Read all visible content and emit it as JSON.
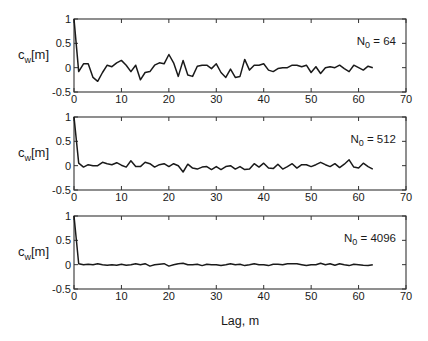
{
  "figure": {
    "xlabel": "Lag, m",
    "ylabel_main": "c",
    "ylabel_sub": "w",
    "ylabel_tail": "[m]"
  },
  "chart_data": [
    {
      "type": "line",
      "title": "",
      "annotation": {
        "main": "N",
        "sub": "0",
        "tail": " = 64"
      },
      "xlabel": "",
      "ylabel": "c_w[m]",
      "xlim": [
        0,
        70
      ],
      "ylim": [
        -0.5,
        1
      ],
      "xticks": [
        0,
        10,
        20,
        30,
        40,
        50,
        60,
        70
      ],
      "yticks": [
        -0.5,
        0,
        0.5,
        1
      ],
      "ytick_labels": [
        "-0.5",
        "0",
        "0.5",
        "1"
      ],
      "grid": false,
      "x": [
        0,
        1,
        2,
        3,
        4,
        5,
        6,
        7,
        8,
        9,
        10,
        11,
        12,
        13,
        14,
        15,
        16,
        17,
        18,
        19,
        20,
        21,
        22,
        23,
        24,
        25,
        26,
        27,
        28,
        29,
        30,
        31,
        32,
        33,
        34,
        35,
        36,
        37,
        38,
        39,
        40,
        41,
        42,
        43,
        44,
        45,
        46,
        47,
        48,
        49,
        50,
        51,
        52,
        53,
        54,
        55,
        56,
        57,
        58,
        59,
        60,
        61,
        62,
        63
      ],
      "values": [
        1.0,
        -0.08,
        0.08,
        0.08,
        -0.2,
        -0.28,
        -0.1,
        0.05,
        0.02,
        0.1,
        0.15,
        0.05,
        -0.08,
        0.05,
        -0.25,
        -0.1,
        -0.08,
        0.05,
        0.1,
        0.08,
        0.27,
        0.1,
        -0.18,
        0.15,
        -0.15,
        -0.18,
        0.03,
        0.05,
        0.05,
        -0.02,
        0.08,
        -0.1,
        -0.2,
        -0.03,
        -0.2,
        -0.18,
        0.17,
        -0.05,
        0.05,
        0.05,
        0.08,
        -0.05,
        -0.08,
        -0.02,
        0.0,
        0.0,
        0.05,
        0.05,
        0.02,
        0.05,
        -0.1,
        0.02,
        -0.12,
        0.0,
        0.02,
        0.0,
        0.05,
        -0.02,
        -0.08,
        0.05,
        0.0,
        -0.05,
        0.03,
        0.0
      ]
    },
    {
      "type": "line",
      "title": "",
      "annotation": {
        "main": "N",
        "sub": "0",
        "tail": " = 512"
      },
      "xlabel": "",
      "ylabel": "c_w[m]",
      "xlim": [
        0,
        70
      ],
      "ylim": [
        -0.5,
        1
      ],
      "xticks": [
        0,
        10,
        20,
        30,
        40,
        50,
        60,
        70
      ],
      "yticks": [
        -0.5,
        0,
        0.5,
        1
      ],
      "ytick_labels": [
        "-0.5",
        "0",
        "0.5",
        "1"
      ],
      "grid": false,
      "x": [
        0,
        1,
        2,
        3,
        4,
        5,
        6,
        7,
        8,
        9,
        10,
        11,
        12,
        13,
        14,
        15,
        16,
        17,
        18,
        19,
        20,
        21,
        22,
        23,
        24,
        25,
        26,
        27,
        28,
        29,
        30,
        31,
        32,
        33,
        34,
        35,
        36,
        37,
        38,
        39,
        40,
        41,
        42,
        43,
        44,
        45,
        46,
        47,
        48,
        49,
        50,
        51,
        52,
        53,
        54,
        55,
        56,
        57,
        58,
        59,
        60,
        61,
        62,
        63
      ],
      "values": [
        1.0,
        0.05,
        -0.03,
        0.02,
        0.0,
        0.0,
        0.07,
        0.04,
        0.02,
        0.06,
        0.01,
        -0.03,
        0.1,
        -0.02,
        -0.02,
        0.07,
        0.04,
        -0.03,
        0.02,
        0.04,
        -0.02,
        0.04,
        0.0,
        -0.13,
        0.03,
        -0.05,
        -0.07,
        -0.03,
        -0.02,
        -0.08,
        -0.02,
        -0.08,
        -0.02,
        0.0,
        -0.07,
        -0.02,
        -0.08,
        -0.07,
        0.04,
        -0.03,
        0.05,
        -0.05,
        -0.06,
        0.03,
        -0.07,
        -0.02,
        0.04,
        -0.05,
        0.02,
        0.02,
        -0.02,
        0.02,
        0.07,
        0.02,
        -0.02,
        0.04,
        -0.04,
        0.03,
        0.12,
        -0.03,
        -0.05,
        0.05,
        -0.02,
        -0.07
      ]
    },
    {
      "type": "line",
      "title": "",
      "annotation": {
        "main": "N",
        "sub": "0",
        "tail": " = 4096"
      },
      "xlabel": "Lag, m",
      "ylabel": "c_w[m]",
      "xlim": [
        0,
        70
      ],
      "ylim": [
        -0.5,
        1
      ],
      "xticks": [
        0,
        10,
        20,
        30,
        40,
        50,
        60,
        70
      ],
      "yticks": [
        -0.5,
        0,
        0.5,
        1
      ],
      "ytick_labels": [
        "-0.5",
        "0",
        "0.5",
        "1"
      ],
      "grid": false,
      "x": [
        0,
        1,
        2,
        3,
        4,
        5,
        6,
        7,
        8,
        9,
        10,
        11,
        12,
        13,
        14,
        15,
        16,
        17,
        18,
        19,
        20,
        21,
        22,
        23,
        24,
        25,
        26,
        27,
        28,
        29,
        30,
        31,
        32,
        33,
        34,
        35,
        36,
        37,
        38,
        39,
        40,
        41,
        42,
        43,
        44,
        45,
        46,
        47,
        48,
        49,
        50,
        51,
        52,
        53,
        54,
        55,
        56,
        57,
        58,
        59,
        60,
        61,
        62,
        63
      ],
      "values": [
        1.0,
        0.02,
        0.0,
        0.01,
        0.0,
        0.02,
        0.0,
        -0.01,
        0.0,
        -0.01,
        0.01,
        -0.01,
        0.0,
        0.02,
        0.0,
        0.02,
        -0.03,
        0.0,
        0.01,
        0.02,
        -0.03,
        0.0,
        0.02,
        0.03,
        0.0,
        0.0,
        0.01,
        -0.02,
        0.01,
        0.0,
        0.0,
        -0.02,
        0.0,
        0.02,
        0.0,
        0.01,
        -0.02,
        0.0,
        0.02,
        0.0,
        0.0,
        -0.02,
        0.01,
        0.01,
        0.0,
        0.02,
        0.02,
        0.02,
        0.0,
        -0.02,
        0.0,
        0.0,
        0.03,
        0.0,
        0.02,
        -0.01,
        0.02,
        0.0,
        -0.02,
        0.01,
        0.0,
        -0.01,
        -0.02,
        0.0
      ]
    }
  ]
}
